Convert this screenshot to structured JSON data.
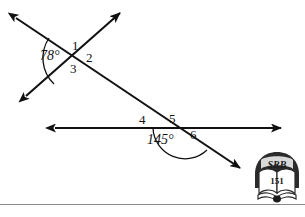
{
  "figure": {
    "background_color": "#ffffff",
    "stroke_color": "#111111",
    "angles": [
      {
        "id": "angle-78",
        "text": "78°",
        "value": 78,
        "unit": "degrees",
        "vertex": "intersection-1"
      },
      {
        "id": "angle-145",
        "text": "145°",
        "value": 145,
        "unit": "degrees",
        "vertex": "intersection-2"
      }
    ],
    "numbered_angles": [
      {
        "id": "label-1",
        "text": "1"
      },
      {
        "id": "label-2",
        "text": "2"
      },
      {
        "id": "label-3",
        "text": "3"
      },
      {
        "id": "label-4",
        "text": "4"
      },
      {
        "id": "label-5",
        "text": "5"
      },
      {
        "id": "label-6",
        "text": "6"
      }
    ]
  },
  "logo": {
    "name": "srb-book-logo",
    "top_text": "SRB",
    "page_number": "151",
    "shield_color": "#2b2b2b",
    "text_color": "#1a1a1a"
  }
}
